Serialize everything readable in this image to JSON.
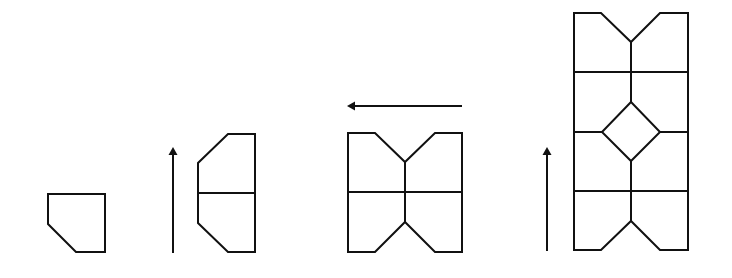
{
  "diagram": {
    "stroke_color": "#111111",
    "background": "#ffffff",
    "steps": [
      {
        "id": "step-1",
        "label": "single pentagon tile"
      },
      {
        "id": "step-2",
        "label": "tile reflected vertically (two tiles)"
      },
      {
        "id": "step-3",
        "label": "pair reflected horizontally (four tiles)"
      },
      {
        "id": "step-4",
        "label": "block reflected vertically (eight tiles with central diamond)"
      }
    ],
    "arrows": [
      {
        "id": "arrow-up-1",
        "direction": "up"
      },
      {
        "id": "arrow-left",
        "direction": "left"
      },
      {
        "id": "arrow-up-2",
        "direction": "up"
      }
    ]
  }
}
